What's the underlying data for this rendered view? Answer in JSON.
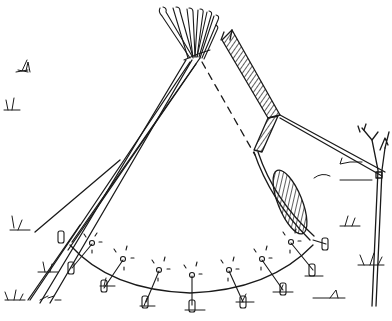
{
  "image": {
    "subject": "Line drawing of a tipi with guy rope tied to a small tree",
    "style": "black ink sketch on white",
    "colors": {
      "ink": "#1a1a1a",
      "background": "#ffffff"
    },
    "elements": {
      "poles": {
        "count": 8,
        "description": "fan of pole tips at apex"
      },
      "smoke_flaps": {
        "count": 2,
        "hatched": true
      },
      "stakes": {
        "count": 9,
        "description": "pegs along the base with tie-down lines"
      },
      "door": {
        "hatched": true,
        "position": "right side"
      },
      "tree": {
        "description": "small bare sapling at right holding guy rope"
      }
    }
  }
}
